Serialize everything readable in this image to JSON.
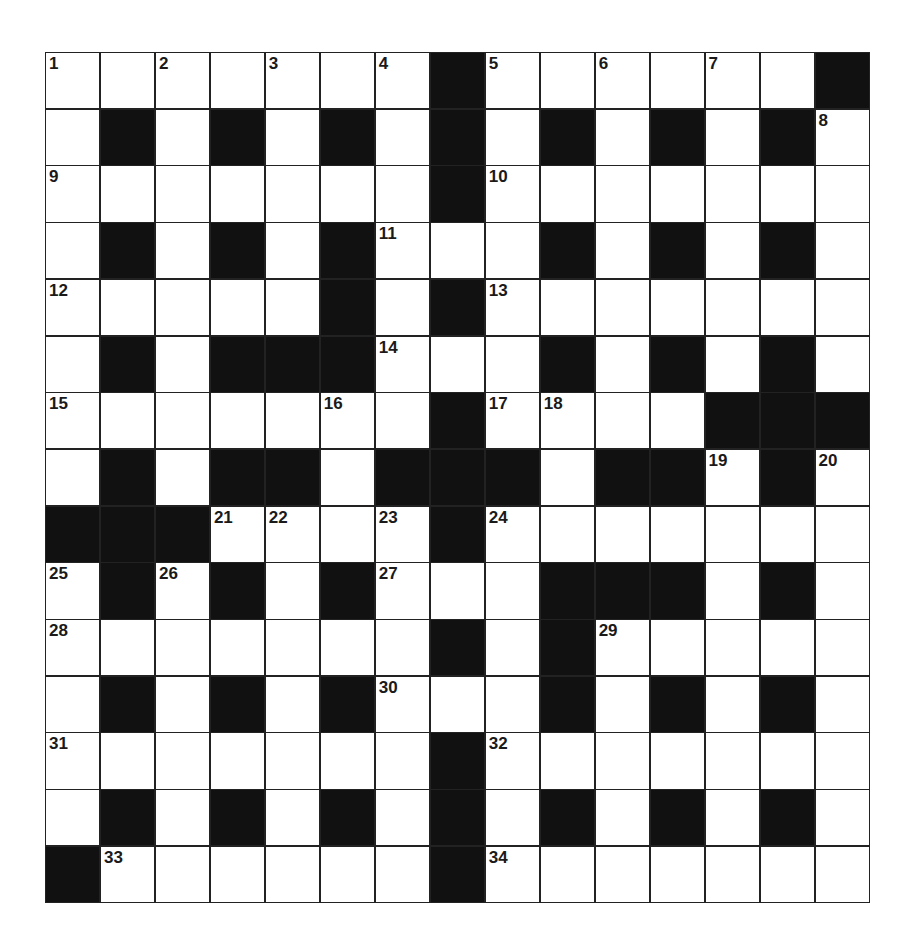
{
  "puzzle": {
    "rows": 15,
    "cols": 15,
    "layout": [
      ".......#......#",
      ".#.#.#.#.#.#.#.",
      ".......#.......",
      ".#.#.#...#.#.#.",
      ".....#.#.......",
      ".#.###...#.#.#.",
      ".......#....###",
      ".#.##.###.##.#.",
      "###....#.......",
      ".#.#.#...###.#.",
      ".......#.#.....",
      ".#.#.#...#.#.#.",
      ".......#.......",
      ".#.#.#.#.#.#.#.",
      "#......#......."
    ],
    "numbers": [
      {
        "r": 0,
        "c": 0,
        "n": "1"
      },
      {
        "r": 0,
        "c": 2,
        "n": "2"
      },
      {
        "r": 0,
        "c": 4,
        "n": "3"
      },
      {
        "r": 0,
        "c": 6,
        "n": "4"
      },
      {
        "r": 0,
        "c": 8,
        "n": "5"
      },
      {
        "r": 0,
        "c": 10,
        "n": "6"
      },
      {
        "r": 0,
        "c": 12,
        "n": "7"
      },
      {
        "r": 1,
        "c": 14,
        "n": "8"
      },
      {
        "r": 2,
        "c": 0,
        "n": "9"
      },
      {
        "r": 2,
        "c": 8,
        "n": "10"
      },
      {
        "r": 3,
        "c": 6,
        "n": "11"
      },
      {
        "r": 4,
        "c": 0,
        "n": "12"
      },
      {
        "r": 4,
        "c": 8,
        "n": "13"
      },
      {
        "r": 5,
        "c": 6,
        "n": "14"
      },
      {
        "r": 6,
        "c": 0,
        "n": "15"
      },
      {
        "r": 6,
        "c": 5,
        "n": "16"
      },
      {
        "r": 6,
        "c": 8,
        "n": "17"
      },
      {
        "r": 6,
        "c": 9,
        "n": "18"
      },
      {
        "r": 7,
        "c": 12,
        "n": "19"
      },
      {
        "r": 7,
        "c": 14,
        "n": "20"
      },
      {
        "r": 8,
        "c": 3,
        "n": "21"
      },
      {
        "r": 8,
        "c": 4,
        "n": "22"
      },
      {
        "r": 8,
        "c": 6,
        "n": "23"
      },
      {
        "r": 8,
        "c": 8,
        "n": "24"
      },
      {
        "r": 9,
        "c": 0,
        "n": "25"
      },
      {
        "r": 9,
        "c": 2,
        "n": "26"
      },
      {
        "r": 9,
        "c": 6,
        "n": "27"
      },
      {
        "r": 10,
        "c": 0,
        "n": "28"
      },
      {
        "r": 10,
        "c": 10,
        "n": "29"
      },
      {
        "r": 11,
        "c": 6,
        "n": "30"
      },
      {
        "r": 12,
        "c": 0,
        "n": "31"
      },
      {
        "r": 12,
        "c": 8,
        "n": "32"
      },
      {
        "r": 14,
        "c": 1,
        "n": "33"
      },
      {
        "r": 14,
        "c": 8,
        "n": "34"
      }
    ],
    "colors": {
      "black_cell": "#111111",
      "white_cell": "#ffffff",
      "grid_line": "#222222"
    }
  }
}
